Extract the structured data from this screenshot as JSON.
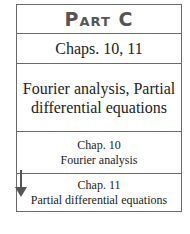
{
  "part": {
    "title": "Part C"
  },
  "chapters_header": "Chaps. 10, 11",
  "topics_header": "Fourier analysis, Partial differential equations",
  "chapters": [
    {
      "chapter": "Chap. 10",
      "title": "Fourier analysis"
    },
    {
      "chapter": "Chap. 11",
      "title": "Partial differential equations"
    }
  ],
  "icons": {
    "arrow": "arrow-down-icon"
  },
  "colors": {
    "border": "#6a6a6a",
    "title": "#555555",
    "arrow": "#555555"
  }
}
